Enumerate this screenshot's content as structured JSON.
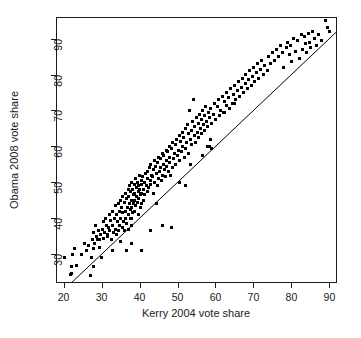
{
  "chart_data": {
    "type": "scatter",
    "title": "",
    "subtitle": "",
    "xlabel": "Kerry 2004 vote share",
    "ylabel": "Obama 2008 vote share",
    "xlim": [
      18,
      92
    ],
    "ylim": [
      22,
      96
    ],
    "xticks": [
      20,
      30,
      40,
      50,
      60,
      70,
      80,
      90
    ],
    "yticks": [
      30,
      40,
      50,
      60,
      70,
      80,
      90
    ],
    "xtick_labels": [
      "20",
      "30",
      "40",
      "50",
      "60",
      "70",
      "80",
      "90"
    ],
    "ytick_labels": [
      "30",
      "40",
      "50",
      "60",
      "70",
      "80",
      "90"
    ],
    "grid": false,
    "legend": null,
    "legend_position": "none",
    "point_color": "#000000",
    "point_marker": "square",
    "point_size_px": 3,
    "reference_line": {
      "name": "y = x identity line",
      "type": "line",
      "slope": 1,
      "intercept": 0,
      "x_start": 20,
      "y_start": 20,
      "x_end": 92,
      "y_end": 92,
      "color": "#000000",
      "width_px": 1
    },
    "series": [
      {
        "name": "U.S. congressional districts",
        "x": [
          20.2,
          21.8,
          22.0,
          22.2,
          22.4,
          23.0,
          23.3,
          24.6,
          25.5,
          26.0,
          26.5,
          27.0,
          27.4,
          27.6,
          27.8,
          27.8,
          28.0,
          28.2,
          28.4,
          28.6,
          28.9,
          29.2,
          29.5,
          29.8,
          30.0,
          30.2,
          30.4,
          30.6,
          30.8,
          31.0,
          31.2,
          31.5,
          31.8,
          32.0,
          32.2,
          32.4,
          32.6,
          32.8,
          33.0,
          33.2,
          33.4,
          33.6,
          33.8,
          34.0,
          34.0,
          34.2,
          34.4,
          34.4,
          34.6,
          34.8,
          35.0,
          35.0,
          35.2,
          35.4,
          35.4,
          35.6,
          35.8,
          36.0,
          36.0,
          36.2,
          36.2,
          36.4,
          36.6,
          36.6,
          36.8,
          37.0,
          37.0,
          37.2,
          37.2,
          37.4,
          37.4,
          37.6,
          37.6,
          37.8,
          37.8,
          38.0,
          38.0,
          38.0,
          38.2,
          38.2,
          38.4,
          38.4,
          38.6,
          38.6,
          38.8,
          38.8,
          39.0,
          39.0,
          39.2,
          39.2,
          39.4,
          39.4,
          39.6,
          39.6,
          39.8,
          39.8,
          40.0,
          40.0,
          40.2,
          40.2,
          40.4,
          40.4,
          40.6,
          40.6,
          40.8,
          41.0,
          41.0,
          41.2,
          41.4,
          41.6,
          41.8,
          42.0,
          42.0,
          42.2,
          42.4,
          42.6,
          42.8,
          43.0,
          43.0,
          43.2,
          43.4,
          43.6,
          43.8,
          44.0,
          44.0,
          44.2,
          44.4,
          44.6,
          44.8,
          45.0,
          45.0,
          45.2,
          45.4,
          45.6,
          45.8,
          46.0,
          46.0,
          46.2,
          46.4,
          46.6,
          46.8,
          47.0,
          47.0,
          47.2,
          47.4,
          47.6,
          47.8,
          48.0,
          48.0,
          48.2,
          48.4,
          48.6,
          48.8,
          49.0,
          49.2,
          49.4,
          49.6,
          49.8,
          50.0,
          50.2,
          50.4,
          50.6,
          50.8,
          51.0,
          51.2,
          51.4,
          51.6,
          51.8,
          52.0,
          52.2,
          52.4,
          52.6,
          52.8,
          53.0,
          53.2,
          53.4,
          53.6,
          53.8,
          54.0,
          54.2,
          54.4,
          54.6,
          54.8,
          55.0,
          55.2,
          55.4,
          55.6,
          55.8,
          56.0,
          56.2,
          56.4,
          56.6,
          56.8,
          57.0,
          57.2,
          57.4,
          57.6,
          57.8,
          58.0,
          58.2,
          58.4,
          58.6,
          58.8,
          59.0,
          59.4,
          59.8,
          60.0,
          60.4,
          60.8,
          61.0,
          61.4,
          61.8,
          62.0,
          62.4,
          62.8,
          63.0,
          63.4,
          63.8,
          64.0,
          64.4,
          64.8,
          65.0,
          65.4,
          65.8,
          66.0,
          66.4,
          66.8,
          67.0,
          67.4,
          67.8,
          68.0,
          68.4,
          68.8,
          69.0,
          69.4,
          69.8,
          70.0,
          70.4,
          70.8,
          71.0,
          71.4,
          71.8,
          72.0,
          72.6,
          73.0,
          73.6,
          74.0,
          74.6,
          75.0,
          75.6,
          76.0,
          76.6,
          77.0,
          77.6,
          78.0,
          78.6,
          79.0,
          79.4,
          79.8,
          80.0,
          80.6,
          81.0,
          81.6,
          82.0,
          82.6,
          83.0,
          83.4,
          83.8,
          84.0,
          84.4,
          84.8,
          85.0,
          85.6,
          86.0,
          86.6,
          87.0,
          88.0,
          89.0,
          89.4,
          90.0,
          33.0,
          35.0,
          36.5,
          38.0,
          40.5,
          43.0,
          46.0,
          48.5,
          52.0,
          56.5,
          59.0,
          62.5,
          65.0,
          29.5,
          31.5,
          37.5,
          44.5,
          50.5,
          53.5,
          58.5
        ],
        "y": [
          29.0,
          24.5,
          24.6,
          26.5,
          30.0,
          31.5,
          27.0,
          30.0,
          33.0,
          31.0,
          32.5,
          24.0,
          29.0,
          34.0,
          36.0,
          31.5,
          26.5,
          33.0,
          38.0,
          35.0,
          34.0,
          36.5,
          32.0,
          35.5,
          29.0,
          37.0,
          34.5,
          39.0,
          36.0,
          40.0,
          38.0,
          35.0,
          37.5,
          41.0,
          36.5,
          39.5,
          34.0,
          38.0,
          42.0,
          36.0,
          40.0,
          43.5,
          37.0,
          41.0,
          35.5,
          39.0,
          44.0,
          36.5,
          42.0,
          38.0,
          45.0,
          40.0,
          43.0,
          37.5,
          46.0,
          41.5,
          39.0,
          44.5,
          36.5,
          47.0,
          42.0,
          40.0,
          45.5,
          38.5,
          43.0,
          48.0,
          41.0,
          46.0,
          37.0,
          44.0,
          49.0,
          42.5,
          47.5,
          40.0,
          45.0,
          50.0,
          43.0,
          38.0,
          48.0,
          41.5,
          46.5,
          44.0,
          49.5,
          42.0,
          47.0,
          45.0,
          51.0,
          43.5,
          48.5,
          46.0,
          50.0,
          44.5,
          47.5,
          41.0,
          49.0,
          45.5,
          52.0,
          48.0,
          46.5,
          43.0,
          50.5,
          47.0,
          44.0,
          49.5,
          51.5,
          48.0,
          45.0,
          50.0,
          46.5,
          52.5,
          49.0,
          53.0,
          47.5,
          51.0,
          48.5,
          54.0,
          50.5,
          55.0,
          49.5,
          52.0,
          51.5,
          47.0,
          53.5,
          56.0,
          50.0,
          54.5,
          52.5,
          49.0,
          55.5,
          57.0,
          51.0,
          53.0,
          56.5,
          54.0,
          50.5,
          58.0,
          52.0,
          55.0,
          57.5,
          53.5,
          51.5,
          59.0,
          54.5,
          56.0,
          58.5,
          53.0,
          55.5,
          60.0,
          57.0,
          52.0,
          59.5,
          54.0,
          61.0,
          56.5,
          58.0,
          60.5,
          55.0,
          62.0,
          57.5,
          59.0,
          63.0,
          56.0,
          61.5,
          58.5,
          64.0,
          60.0,
          62.5,
          57.0,
          65.0,
          59.5,
          61.0,
          66.0,
          63.5,
          58.0,
          70.0,
          62.0,
          64.5,
          60.5,
          67.0,
          73.0,
          63.0,
          65.5,
          61.0,
          68.0,
          64.0,
          66.5,
          62.5,
          69.0,
          65.0,
          67.5,
          63.5,
          70.0,
          66.0,
          68.5,
          64.5,
          71.0,
          67.0,
          60.0,
          65.5,
          69.5,
          68.0,
          62.0,
          70.5,
          66.5,
          69.0,
          72.0,
          67.5,
          71.0,
          73.0,
          68.5,
          70.0,
          74.0,
          69.5,
          72.5,
          71.5,
          75.0,
          73.5,
          70.5,
          76.0,
          72.0,
          74.5,
          77.0,
          73.0,
          75.5,
          78.0,
          74.0,
          76.5,
          79.0,
          75.0,
          77.5,
          80.0,
          76.0,
          78.5,
          81.0,
          77.0,
          79.5,
          82.0,
          78.0,
          80.5,
          83.0,
          79.0,
          81.5,
          84.0,
          80.0,
          82.5,
          81.0,
          85.0,
          83.0,
          86.0,
          84.0,
          87.0,
          85.0,
          88.0,
          86.0,
          82.0,
          87.5,
          89.0,
          85.5,
          88.0,
          83.5,
          90.0,
          86.5,
          89.5,
          84.5,
          91.0,
          87.0,
          90.5,
          88.5,
          86.0,
          91.5,
          89.0,
          87.5,
          92.0,
          90.0,
          88.0,
          91.0,
          89.5,
          95.0,
          93.0,
          92.0,
          31.0,
          33.5,
          31.0,
          33.0,
          31.0,
          36.5,
          38.0,
          37.5,
          49.0,
          57.5,
          59.5,
          69.5,
          72.0,
          34.0,
          35.5,
          40.0,
          44.0,
          50.0,
          55.0,
          60.0
        ]
      }
    ]
  },
  "axes": {
    "x_tick_values": [
      "20",
      "30",
      "40",
      "50",
      "60",
      "70",
      "80",
      "90"
    ],
    "y_tick_values": [
      "30",
      "40",
      "50",
      "60",
      "70",
      "80",
      "90"
    ]
  }
}
